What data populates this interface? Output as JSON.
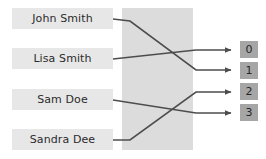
{
  "diagram": {
    "canvas": {
      "width": 266,
      "height": 159,
      "background": "#ffffff"
    },
    "hash_region": {
      "label": "",
      "fill": "#dcdcdc"
    },
    "line_color": "#4d4d4d",
    "keys": [
      {
        "label": "John Smith",
        "top": 8,
        "maps_to": "1"
      },
      {
        "label": "Lisa Smith",
        "top": 48,
        "maps_to": "0"
      },
      {
        "label": "Sam Doe",
        "top": 89,
        "maps_to": "3"
      },
      {
        "label": "Sandra Dee",
        "top": 129,
        "maps_to": "2"
      }
    ],
    "buckets": [
      {
        "label": "0",
        "top": 40
      },
      {
        "label": "1",
        "top": 61
      },
      {
        "label": "2",
        "top": 82
      },
      {
        "label": "3",
        "top": 103
      }
    ],
    "edges": [
      {
        "from": "John Smith",
        "to": "0",
        "path": "M113,18 L128,20 L196,69 L236,69"
      },
      {
        "from": "Lisa Smith",
        "to": "1",
        "path": "M113,58 L196,49 L236,49"
      },
      {
        "from": "Sam Doe",
        "to": "3",
        "path": "M113,99 L196,112 L236,112"
      },
      {
        "from": "Sandra Dee",
        "to": "2",
        "path": "M113,139 L128,139 L196,91 L236,91"
      }
    ]
  }
}
